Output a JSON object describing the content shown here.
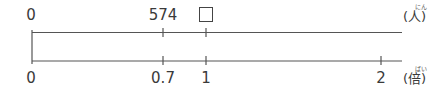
{
  "diagram": {
    "type": "double-number-line",
    "top_line": {
      "unit": "(人)",
      "unit_ruby": "にん",
      "labels": [
        {
          "value": "0",
          "x": 32
        },
        {
          "value": "574",
          "x": 163
        },
        {
          "value": "□",
          "x": 206,
          "is_blank_box": true
        }
      ]
    },
    "bottom_line": {
      "unit": "(倍)",
      "unit_ruby": "ばい",
      "labels": [
        {
          "value": "0",
          "x": 32
        },
        {
          "value": "0.7",
          "x": 163
        },
        {
          "value": "1",
          "x": 206
        },
        {
          "value": "2",
          "x": 381
        }
      ]
    },
    "colors": {
      "line": "#555555",
      "text": "#3a3a3a"
    }
  }
}
